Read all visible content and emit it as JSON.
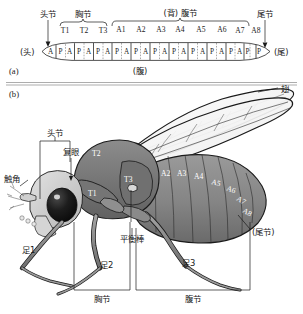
{
  "figure": {
    "panels": [
      {
        "id": "a",
        "label": "(a)"
      },
      {
        "id": "b",
        "label": "(b)"
      }
    ]
  },
  "panel_a": {
    "label": "(a)",
    "anterior_end_label": "(头)",
    "posterior_end_label": "(尾)",
    "ventral_label": "(腹)",
    "brackets": [
      {
        "name": "head",
        "label": "头节"
      },
      {
        "name": "thorax",
        "label": "胸节"
      },
      {
        "name": "abdomen",
        "label": "(背) 腹节"
      },
      {
        "name": "telson",
        "label": "尾节"
      }
    ],
    "segment_labels": [
      "T1",
      "T2",
      "T3",
      "A1",
      "A2",
      "A3",
      "A4",
      "A5",
      "A6",
      "A7",
      "A8"
    ],
    "compartment_labels": [
      "A",
      "P"
    ],
    "compartments_note": [
      "A",
      "P",
      "A",
      "P",
      "A",
      "P",
      "A",
      "P",
      "A",
      "P",
      "A",
      "P",
      "A",
      "P",
      "A",
      "P",
      "A",
      "P",
      "A",
      "P",
      "A",
      "P",
      "A",
      "P"
    ]
  },
  "panel_b": {
    "label": "(b)",
    "callouts": [
      {
        "name": "wing",
        "label": "翅"
      },
      {
        "name": "head-segment",
        "label": "头节"
      },
      {
        "name": "compound-eye",
        "label": "复眼"
      },
      {
        "name": "antenna",
        "label": "触角"
      },
      {
        "name": "haltere",
        "label": "平衡棒"
      },
      {
        "name": "telson",
        "label": "(尾节)"
      }
    ],
    "body_segment_labels": {
      "thoracic": [
        "T1",
        "T2",
        "T3"
      ],
      "abdominal": [
        "A1",
        "A2",
        "A3",
        "A4",
        "A5",
        "A6",
        "A7",
        "A8"
      ]
    },
    "legs": [
      "足1",
      "足2",
      "足3"
    ],
    "bottom_brackets": [
      {
        "name": "thorax",
        "label": "胸节"
      },
      {
        "name": "abdomen",
        "label": "腹节"
      }
    ]
  },
  "colors": {
    "ink": "#1a1a1a",
    "body_dark": "#6e6e6e",
    "body_mid": "#8d8d8d",
    "body_light": "#b4b4b4",
    "head_light": "#d8d8d8",
    "eye": "#121212",
    "paper": "#ffffff",
    "rule": "#8a8a8a"
  }
}
